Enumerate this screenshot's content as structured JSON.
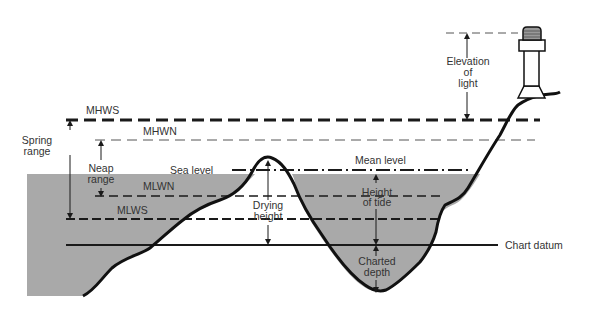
{
  "diagram": {
    "type": "tidal-levels-cross-section",
    "levels": {
      "mhws": "MHWS",
      "mhwn": "MHWN",
      "mlwn": "MLWN",
      "mlws": "MLWS",
      "sea_level": "Sea level",
      "mean_level": "Mean level",
      "chart_datum": "Chart datum"
    },
    "ranges": {
      "spring_range_1": "Spring",
      "spring_range_2": "range",
      "neap_range_1": "Neap",
      "neap_range_2": "range"
    },
    "measurements": {
      "drying_height_1": "Drying",
      "drying_height_2": "height",
      "height_of_tide_1": "Height",
      "height_of_tide_2": "of tide",
      "charted_depth_1": "Charted",
      "charted_depth_2": "depth",
      "elevation_1": "Elevation",
      "elevation_2": "of",
      "elevation_3": "light"
    },
    "colors": {
      "water": "#a9a9a9",
      "line": "#1a1a1a",
      "text": "#333333"
    }
  }
}
